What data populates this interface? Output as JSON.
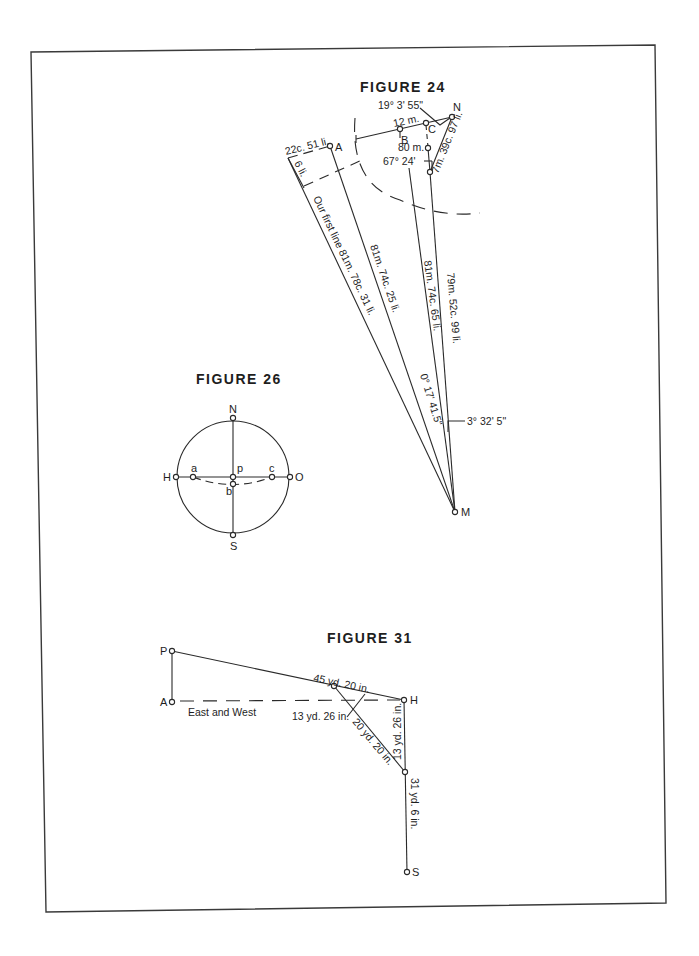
{
  "figures": {
    "fig24": {
      "title": "FIGURE 24",
      "points": {
        "A": "A",
        "B": "B",
        "C": "C",
        "N": "N",
        "M": "M"
      },
      "labels": {
        "angle_top": "19° 3' 55\"",
        "b_dist": "12 m.",
        "c_dist": "80 m.",
        "angle_mid": "67° 24'",
        "n_side": "7m. 39c. 97 li.",
        "a_offset": "22c. 51 li.",
        "a_perp": "6 li.",
        "first_line": "Our first line  81m. 78c. 31 li.",
        "line_a": "81m. 74c. 25 li.",
        "line_b": "81m. 74c. 65 li.",
        "line_n": "79m. 52c. 99 li.",
        "angle_small": "0° 17' 41.5\"",
        "angle_m": "3° 32' 5\""
      }
    },
    "fig26": {
      "title": "FIGURE 26",
      "points": {
        "N": "N",
        "S": "S",
        "H": "H",
        "O": "O",
        "a": "a",
        "p": "p",
        "c": "c",
        "b": "b"
      }
    },
    "fig31": {
      "title": "FIGURE 31",
      "points": {
        "P": "P",
        "A": "A",
        "H": "H",
        "S": "S"
      },
      "labels": {
        "east_west": "East and West",
        "ph_dist": "45 yd. 20 in.",
        "perp": "13 yd. 26 in.",
        "diag": "20 yd. 20 in.",
        "h_down": "13 yd. 26 in.",
        "lower": "31 yd. 6 in."
      }
    }
  }
}
